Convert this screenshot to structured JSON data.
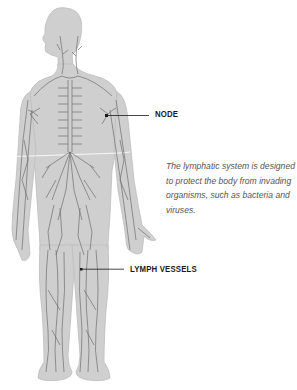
{
  "diagram": {
    "colors": {
      "background": "#ffffff",
      "body_fill": "#cfcfcf",
      "body_outline": "#bdbdbd",
      "vessel": "#6e6e6e",
      "pointer": "#1a1a1a",
      "label_text": "#1a1a1a",
      "caption_text": "#555555"
    },
    "labels": {
      "node": "NODE",
      "lymph_vessels": "LYMPH VESSELS"
    },
    "caption": "The lymphatic system is designed to protect the body from invading organisms, such as bacteria and viruses."
  }
}
